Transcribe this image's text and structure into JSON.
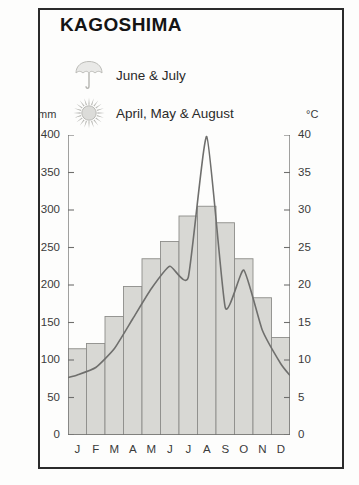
{
  "panel": {
    "title": "KAGOSHIMA"
  },
  "legend": [
    {
      "icon": "umbrella-icon",
      "label": "June & July"
    },
    {
      "icon": "sun-icon",
      "label": "April, May & August"
    }
  ],
  "axes": {
    "left_unit": "mm",
    "right_unit": "°C"
  },
  "colors": {
    "bar_fill": "#d8d8d4",
    "bar_stroke": "#8e8e8a",
    "curve": "#6f6f6d",
    "border": "#2b2b2b",
    "axis": "#6f6f6d",
    "text": "#2a2a2a"
  },
  "chart_data": {
    "type": "bar",
    "title": "KAGOSHIMA",
    "xlabel": "",
    "ylabel": "mm",
    "categories": [
      "J",
      "F",
      "M",
      "A",
      "M",
      "J",
      "J",
      "A",
      "S",
      "O",
      "N",
      "D"
    ],
    "month_names": [
      "January",
      "February",
      "March",
      "April",
      "May",
      "June",
      "July",
      "August",
      "September",
      "October",
      "November",
      "December"
    ],
    "series": [
      {
        "name": "Precipitation",
        "type": "bar",
        "unit": "mm",
        "axis": "left",
        "values": [
          115,
          122,
          158,
          198,
          235,
          258,
          292,
          305,
          283,
          235,
          183,
          130
        ]
      },
      {
        "name": "Temperature",
        "type": "line",
        "unit": "°C",
        "axis": "right",
        "values": [
          8,
          9,
          11.5,
          15.5,
          19.5,
          22.5,
          21.0,
          39.8,
          17.0,
          22.0,
          14.0,
          9.5
        ]
      }
    ],
    "ylim": [
      0,
      400
    ],
    "ylim_right": [
      0,
      40
    ],
    "yticks": [
      0,
      50,
      100,
      150,
      200,
      250,
      300,
      350,
      400
    ],
    "yticks_right": [
      0,
      5,
      10,
      15,
      20,
      25,
      30,
      35,
      40
    ],
    "grid": false,
    "legend_position": "top-left"
  }
}
